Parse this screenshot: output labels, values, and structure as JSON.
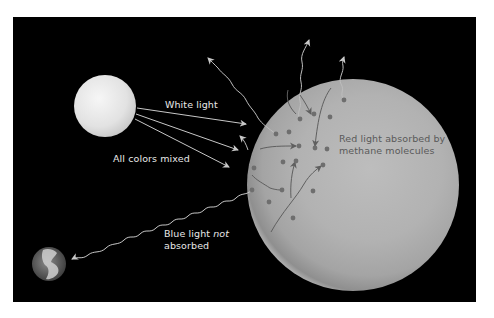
{
  "diagram": {
    "labels": {
      "white_light": "White light",
      "all_colors_mixed": "All colors mixed",
      "blue_light_line1_a": "Blue light ",
      "blue_light_line1_not": "not",
      "blue_light_line2": "absorbed",
      "red_light_line1": "Red light absorbed by",
      "red_light_line2": "methane molecules"
    },
    "objects": {
      "sun": "Sun (white light source)",
      "planet": "Planet atmosphere with methane molecules",
      "earth": "Earth (observer)"
    },
    "colors": {
      "background": "#000000",
      "frame": "#ffffff",
      "sun": "#e6e6e6",
      "planet": "#b4b4b4",
      "molecule": "#6e6e6e",
      "ray": "#c8c8c8",
      "absorbed_path": "#5f5f5f",
      "label_light": "#e8e8e8",
      "label_dark": "#5a5a5a"
    }
  }
}
